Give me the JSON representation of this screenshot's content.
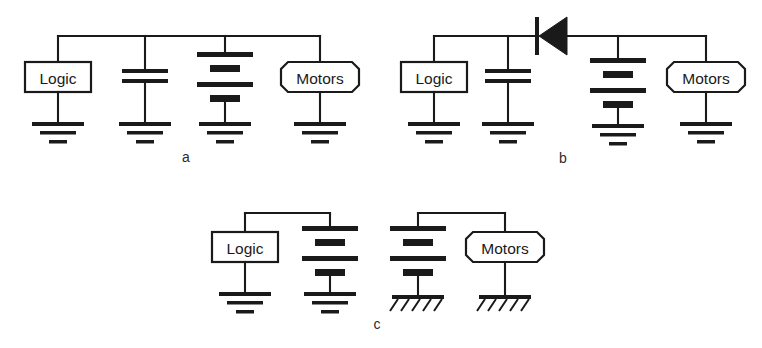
{
  "figure": {
    "background_color": "#ffffff",
    "ink_color": "#1a1a1a",
    "width": 762,
    "height": 348,
    "kind": "schematic-line-art"
  },
  "labels": {
    "logic": "Logic",
    "motors": "Motors",
    "panel_a": "a",
    "panel_b": "b",
    "panel_c": "c"
  },
  "panels": [
    {
      "id": "a",
      "caption": "a",
      "rail": "single common top rail",
      "branches": [
        {
          "name": "logic-block",
          "symbol": "rectangle-box",
          "label": "Logic",
          "ground": "earth-ground"
        },
        {
          "name": "capacitor",
          "symbol": "capacitor",
          "label": "",
          "ground": "earth-ground"
        },
        {
          "name": "battery",
          "symbol": "battery",
          "label": "",
          "ground": "earth-ground"
        },
        {
          "name": "motors-block",
          "symbol": "octagon-box",
          "label": "Motors",
          "ground": "earth-ground"
        }
      ]
    },
    {
      "id": "b",
      "caption": "b",
      "rail": "single top rail interrupted by a diode",
      "series_element": {
        "name": "diode",
        "symbol": "diode",
        "orientation": "cathode-left"
      },
      "branches": [
        {
          "name": "logic-block",
          "symbol": "rectangle-box",
          "label": "Logic",
          "ground": "earth-ground"
        },
        {
          "name": "capacitor",
          "symbol": "capacitor",
          "label": "",
          "ground": "earth-ground"
        },
        {
          "name": "battery",
          "symbol": "battery",
          "label": "",
          "ground": "earth-ground"
        },
        {
          "name": "motors-block",
          "symbol": "octagon-box",
          "label": "Motors",
          "ground": "earth-ground"
        }
      ]
    },
    {
      "id": "c",
      "caption": "c",
      "rail": "two isolated rails",
      "subcircuits": [
        {
          "name": "logic-subcircuit",
          "ground_type": "earth-ground",
          "branches": [
            {
              "name": "logic-block",
              "symbol": "rectangle-box",
              "label": "Logic",
              "ground": "earth-ground"
            },
            {
              "name": "battery",
              "symbol": "battery",
              "label": "",
              "ground": "earth-ground"
            }
          ]
        },
        {
          "name": "motors-subcircuit",
          "ground_type": "chassis-ground",
          "branches": [
            {
              "name": "battery",
              "symbol": "battery",
              "label": "",
              "ground": "chassis-ground"
            },
            {
              "name": "motors-block",
              "symbol": "octagon-box",
              "label": "Motors",
              "ground": "chassis-ground"
            }
          ]
        }
      ]
    }
  ]
}
